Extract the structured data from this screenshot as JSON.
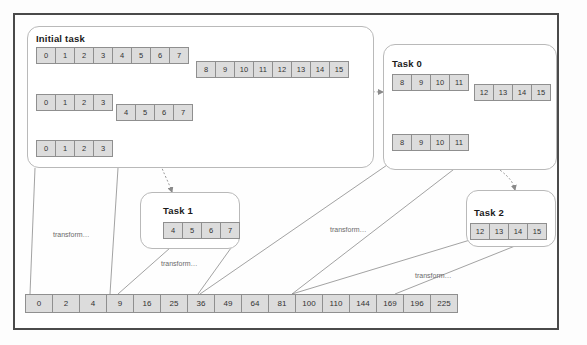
{
  "diagram": {
    "colors": {
      "frame": "#4a4a4a",
      "panel_border": "#b9b9b9",
      "cell_fill": "#dcdcdc",
      "cell_border": "#8f8f8f",
      "text": "#333333",
      "caption": "#6a6a6a"
    },
    "panels": [
      {
        "id": "initial",
        "label": "Initial task"
      },
      {
        "id": "task0",
        "label": "Task 0"
      },
      {
        "id": "task1",
        "label": "Task 1"
      },
      {
        "id": "task2",
        "label": "Task 2"
      }
    ],
    "arrays": {
      "initial_row1_left": [
        "0",
        "1",
        "2",
        "3",
        "4",
        "5",
        "6",
        "7"
      ],
      "initial_row1_right": [
        "8",
        "9",
        "10",
        "11",
        "12",
        "13",
        "14",
        "15"
      ],
      "initial_row2_left": [
        "0",
        "1",
        "2",
        "3"
      ],
      "initial_row2_right": [
        "4",
        "5",
        "6",
        "7"
      ],
      "initial_row3": [
        "0",
        "1",
        "2",
        "3"
      ],
      "task0_row1_left": [
        "8",
        "9",
        "10",
        "11"
      ],
      "task0_row1_right": [
        "12",
        "13",
        "14",
        "15"
      ],
      "task0_row2": [
        "8",
        "9",
        "10",
        "11"
      ],
      "task1_row": [
        "4",
        "5",
        "6",
        "7"
      ],
      "task2_row": [
        "12",
        "13",
        "14",
        "15"
      ],
      "result_row": [
        "0",
        "2",
        "4",
        "9",
        "16",
        "25",
        "36",
        "49",
        "64",
        "81",
        "100",
        "110",
        "144",
        "169",
        "196",
        "225"
      ]
    },
    "captions": {
      "transform_left": "transform…",
      "transform_task1": "transform…",
      "transform_middle": "transform…",
      "transform_task2": "transform…"
    }
  }
}
